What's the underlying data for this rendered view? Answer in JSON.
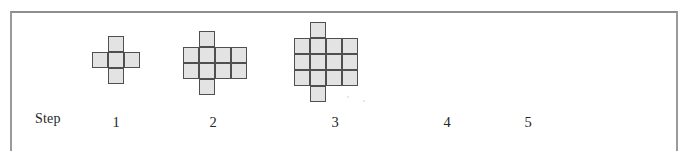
{
  "figure": {
    "title": "Step",
    "frame": {
      "border_color": "#8e8e8e",
      "visible_sides": "top, left, right"
    },
    "tile": {
      "size_px": 16,
      "fill_color": "#e3e3e3",
      "stroke_color": "#4f4f4f"
    },
    "step_label": "Step",
    "steps": [
      {
        "number": "1",
        "drawn": true,
        "tile_count": 5,
        "shape": "plus",
        "grid": {
          "columns": 3,
          "rows": 3,
          "filled_cells": [
            [
              1,
              0
            ],
            [
              0,
              1
            ],
            [
              1,
              1
            ],
            [
              2,
              1
            ],
            [
              1,
              2
            ]
          ]
        },
        "origin": {
          "x": 92,
          "y": 36
        },
        "label_x": 116,
        "label_y": 115
      },
      {
        "number": "2",
        "drawn": true,
        "tile_count": 10,
        "shape": "4x2 block with one tile above and one tile below column 2",
        "grid": {
          "columns": 4,
          "rows": 4,
          "filled_cells": [
            [
              1,
              0
            ],
            [
              0,
              1
            ],
            [
              1,
              1
            ],
            [
              2,
              1
            ],
            [
              3,
              1
            ],
            [
              0,
              2
            ],
            [
              1,
              2
            ],
            [
              2,
              2
            ],
            [
              3,
              2
            ],
            [
              1,
              3
            ]
          ]
        },
        "origin": {
          "x": 183,
          "y": 31
        },
        "label_x": 213,
        "label_y": 115
      },
      {
        "number": "3",
        "drawn": true,
        "tile_count": 14,
        "shape": "4x3 block with one tile above and one tile below column 2",
        "grid": {
          "columns": 4,
          "rows": 5,
          "filled_cells": [
            [
              1,
              0
            ],
            [
              0,
              1
            ],
            [
              1,
              1
            ],
            [
              2,
              1
            ],
            [
              3,
              1
            ],
            [
              0,
              2
            ],
            [
              1,
              2
            ],
            [
              2,
              2
            ],
            [
              3,
              2
            ],
            [
              0,
              3
            ],
            [
              1,
              3
            ],
            [
              2,
              3
            ],
            [
              3,
              3
            ],
            [
              1,
              4
            ]
          ]
        },
        "origin": {
          "x": 294,
          "y": 22
        },
        "label_x": 335,
        "label_y": 115
      },
      {
        "number": "4",
        "drawn": false,
        "tile_count": null,
        "label_x": 447,
        "label_y": 115
      },
      {
        "number": "5",
        "drawn": false,
        "tile_count": null,
        "label_x": 528,
        "label_y": 115
      }
    ]
  }
}
